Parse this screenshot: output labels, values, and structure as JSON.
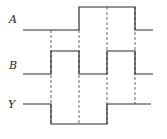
{
  "diagram": {
    "type": "timing-diagram",
    "signals": [
      {
        "name": "A",
        "label_pos": [
          9,
          23
        ],
        "high_y": 7,
        "low_y": 30,
        "levels": [
          0,
          0,
          1,
          1,
          0
        ]
      },
      {
        "name": "B",
        "label_pos": [
          9,
          69
        ],
        "high_y": 51,
        "low_y": 74,
        "levels": [
          0,
          1,
          0,
          1,
          0
        ]
      },
      {
        "name": "Y",
        "label_pos": [
          8,
          108
        ],
        "high_y": 104,
        "low_y": 124,
        "levels": [
          1,
          0,
          0,
          1,
          1
        ]
      }
    ],
    "time_boundaries_x": [
      23,
      51,
      79,
      107,
      135,
      153
    ],
    "dashed_guides": [
      {
        "x": 51,
        "y1": 30,
        "y2": 124
      },
      {
        "x": 79,
        "y1": 30,
        "y2": 124
      },
      {
        "x": 107,
        "y1": 7,
        "y2": 124
      },
      {
        "x": 135,
        "y1": 7,
        "y2": 104
      }
    ],
    "colors": {
      "signal": "#2a2a2a",
      "guide": "#555555",
      "background": "#ffffff"
    }
  }
}
